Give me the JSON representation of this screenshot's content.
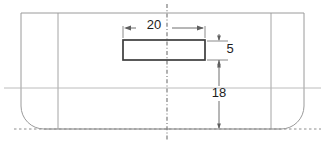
{
  "drawing": {
    "title": "Cross-section elevation view with centreline",
    "background_color": "#ffffff",
    "line_color_outline": "#9a9a9a",
    "line_color_part": "#3c3c3c",
    "line_color_dimension": "#6f6f6f",
    "line_color_centreline": "#8c8c8c",
    "text_color": "#1d1d1d",
    "units_note": "",
    "dimensions": [
      {
        "id": "width-20",
        "label": "20",
        "orientation": "horizontal",
        "value": 20,
        "position": "above-slot"
      },
      {
        "id": "height-5",
        "label": "5",
        "orientation": "vertical",
        "value": 5,
        "position": "right-of-slot"
      },
      {
        "id": "height-18",
        "label": "18",
        "orientation": "vertical",
        "value": 18,
        "position": "right-lower"
      }
    ],
    "features": {
      "slot_rectangle": {
        "name": "slot-rectangle",
        "width_label": "20",
        "height_label": "5"
      },
      "outline": {
        "name": "body-outline",
        "corner_style": "rounded-bottom-corners"
      },
      "centreline": {
        "name": "vertical-centreline",
        "style": "dash-dot"
      },
      "baseline": {
        "name": "bottom-datum-line",
        "style": "dashed"
      }
    }
  }
}
